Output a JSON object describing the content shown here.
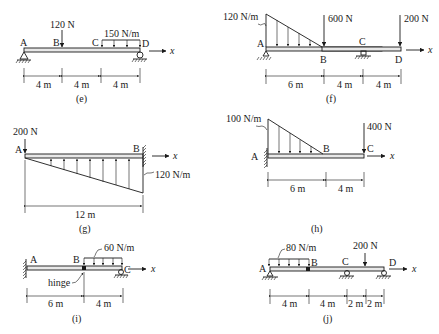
{
  "diagrams": {
    "e": {
      "caption": "(e)",
      "points": [
        "A",
        "B",
        "C",
        "D"
      ],
      "axis": "x",
      "point_load": {
        "label": "120 N",
        "at": "B"
      },
      "distributed_load": {
        "label": "150 N/m",
        "from": "C",
        "to": "D",
        "type": "uniform"
      },
      "spans": [
        "4 m",
        "4 m",
        "4 m"
      ],
      "supports": [
        {
          "at": "A",
          "type": "pin"
        },
        {
          "at": "D",
          "type": "roller"
        }
      ]
    },
    "f": {
      "caption": "(f)",
      "points": [
        "A",
        "B",
        "C",
        "D"
      ],
      "axis": "x",
      "distributed_load": {
        "label": "120 N/m",
        "from": "A",
        "to": "B",
        "type": "triangular"
      },
      "point_loads": [
        {
          "label": "600 N",
          "at": "B"
        },
        {
          "label": "200 N",
          "at": "D"
        }
      ],
      "spans": [
        "6 m",
        "4 m",
        "4 m"
      ],
      "supports": [
        {
          "at": "A",
          "type": "pin"
        },
        {
          "at": "C",
          "type": "roller"
        }
      ]
    },
    "g": {
      "caption": "(g)",
      "points": [
        "A",
        "B"
      ],
      "axis": "x",
      "point_load": {
        "label": "200 N",
        "at": "A"
      },
      "distributed_load": {
        "label": "120 N/m",
        "from": "A",
        "to": "B",
        "type": "triangular-upward"
      },
      "spans": [
        "12 m"
      ],
      "supports": [
        {
          "at": "B",
          "type": "fixed"
        }
      ]
    },
    "h": {
      "caption": "(h)",
      "points": [
        "A",
        "B",
        "C"
      ],
      "axis": "x",
      "distributed_load": {
        "label": "100 N/m",
        "from": "A",
        "to": "B",
        "type": "triangular"
      },
      "point_load": {
        "label": "400 N",
        "at": "C"
      },
      "spans": [
        "6 m",
        "4 m"
      ],
      "supports": [
        {
          "at": "A",
          "type": "fixed"
        }
      ]
    },
    "i": {
      "caption": "(i)",
      "points": [
        "A",
        "B",
        "C"
      ],
      "axis": "x",
      "hinge_label": "hinge",
      "distributed_load": {
        "label": "60 N/m",
        "from": "B",
        "to": "C",
        "type": "uniform"
      },
      "spans": [
        "6 m",
        "4 m"
      ],
      "supports": [
        {
          "at": "A",
          "type": "fixed"
        },
        {
          "at": "C",
          "type": "roller"
        }
      ]
    },
    "j": {
      "caption": "(j)",
      "points": [
        "A",
        "B",
        "C",
        "D"
      ],
      "axis": "x",
      "distributed_load": {
        "label": "80 N/m",
        "from": "A",
        "to": "B",
        "type": "uniform"
      },
      "point_load": {
        "label": "200 N"
      },
      "spans": [
        "4 m",
        "4 m",
        "2 m",
        "2 m"
      ],
      "supports": [
        {
          "at": "A",
          "type": "pin"
        },
        {
          "at": "C",
          "type": "roller"
        },
        {
          "at": "D",
          "type": "roller"
        }
      ]
    }
  }
}
